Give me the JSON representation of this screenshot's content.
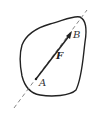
{
  "diagram": {
    "type": "rigid-body-force",
    "body": {
      "shape": "closed-irregular-outline",
      "stroke": "#222222"
    },
    "line_of_action": {
      "style": "dashed",
      "stroke": "#555555"
    },
    "force": {
      "label": "F",
      "tail_point": "A",
      "head_point": "B",
      "stroke": "#222222"
    },
    "points": [
      {
        "label": "A"
      },
      {
        "label": "B"
      }
    ]
  }
}
